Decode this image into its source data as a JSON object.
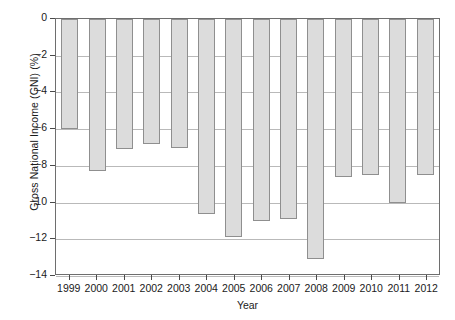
{
  "chart_data": {
    "type": "bar",
    "title": "",
    "xlabel": "Year",
    "ylabel": "Gross National Income (GNI) (%)",
    "categories": [
      "1999",
      "2000",
      "2001",
      "2002",
      "2003",
      "2004",
      "2005",
      "2006",
      "2007",
      "2008",
      "2009",
      "2010",
      "2011",
      "2012"
    ],
    "values": [
      -6.0,
      -8.3,
      -7.1,
      -6.8,
      -7.0,
      -10.6,
      -11.9,
      -11.0,
      -10.9,
      -13.1,
      -8.6,
      -8.5,
      -10.0,
      -8.5
    ],
    "ylim": [
      -14,
      0
    ],
    "yticks": [
      0,
      -2,
      -4,
      -6,
      -8,
      -10,
      -12,
      -14
    ],
    "ytick_labels": [
      "0",
      "−2",
      "−4",
      "−6",
      "−8",
      "−10",
      "−12",
      "−14"
    ],
    "grid": true,
    "legend": null,
    "bar_color": "#dcdcdc",
    "bar_edge_color": "#8f8f8f",
    "grid_color": "#b9b9b9",
    "axis_color": "#6e6e6e",
    "background": "#ffffff"
  }
}
